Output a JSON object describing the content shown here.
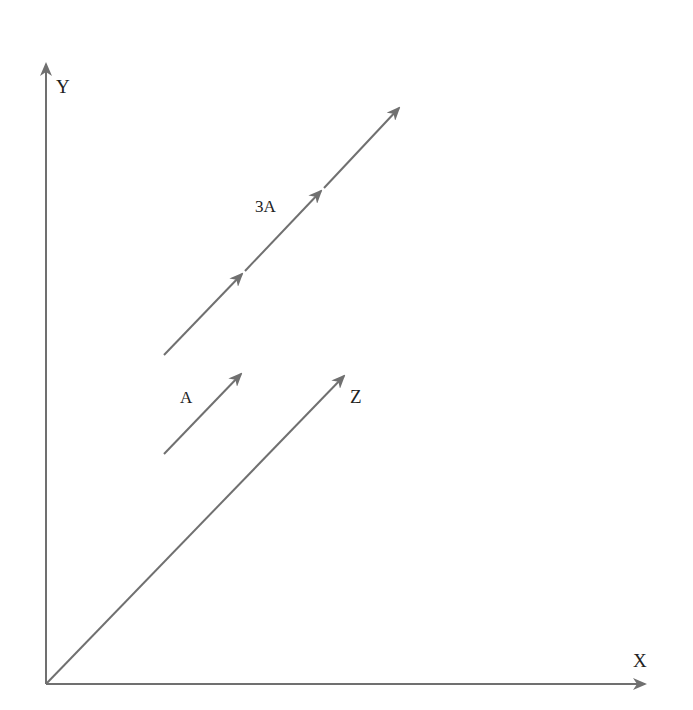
{
  "diagram": {
    "type": "vector-diagram",
    "colors": {
      "line": "#707070",
      "text": "#222222",
      "background": "#ffffff"
    },
    "axes": {
      "y": {
        "label": "Y"
      },
      "x": {
        "label": "X"
      },
      "z": {
        "label": "Z"
      }
    },
    "vectors": [
      {
        "id": "A",
        "label": "A",
        "description": "single-length vector"
      },
      {
        "id": "3A",
        "label": "3A",
        "description": "three times vector A, drawn as three chained A segments"
      }
    ]
  }
}
